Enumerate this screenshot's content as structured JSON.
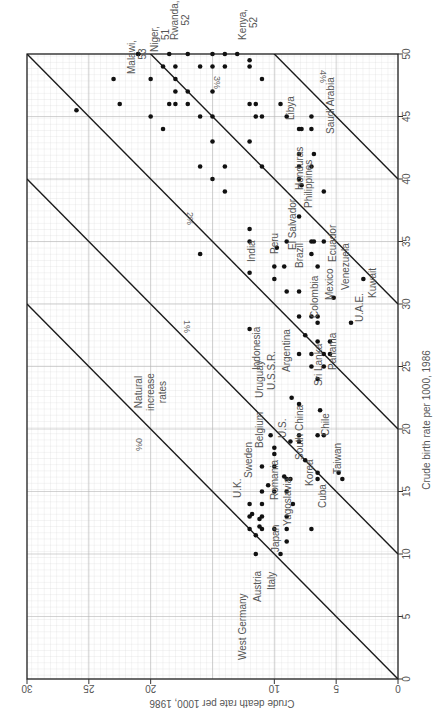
{
  "chart_data": {
    "type": "scatter",
    "title": "",
    "xlabel": "Crude birth rate per 1000, 1986",
    "ylabel": "Crude death rate per 1000, 1986",
    "xlim": [
      0,
      50
    ],
    "ylim": [
      0,
      30
    ],
    "x_ticks": [
      0,
      5,
      10,
      15,
      20,
      25,
      30,
      35,
      40,
      45,
      50
    ],
    "y_ticks": [
      0,
      5,
      10,
      20,
      25,
      30
    ],
    "grid": true,
    "orientation": "rotated 90 degrees clockwise (birth-rate axis on right edge, death-rate axis along bottom, read upside-down)",
    "annotation": "Natural increase rates",
    "reference_lines": [
      {
        "label": "0%",
        "rate": 0
      },
      {
        "label": "1%",
        "rate": 10
      },
      {
        "label": "2%",
        "rate": 20
      },
      {
        "label": "3%",
        "rate": 30
      },
      {
        "label": "4%",
        "rate": 40
      }
    ],
    "labeled_points": [
      {
        "label": "West Germany",
        "birth": 10,
        "death": 11.5
      },
      {
        "label": "Austria",
        "birth": 11.5,
        "death": 11.5
      },
      {
        "label": "Italy",
        "birth": 10,
        "death": 9.5
      },
      {
        "label": "U.K.",
        "birth": 13.2,
        "death": 11.8
      },
      {
        "label": "Sweden",
        "birth": 12.8,
        "death": 11.2
      },
      {
        "label": "Belgium",
        "birth": 12.2,
        "death": 11.2
      },
      {
        "label": "Romania",
        "birth": 15.5,
        "death": 10.5
      },
      {
        "label": "Yugoslavia",
        "birth": 16.2,
        "death": 9.2
      },
      {
        "label": "Uruguay",
        "birth": 18.5,
        "death": 10
      },
      {
        "label": "U.S.S.R.",
        "birth": 19.5,
        "death": 10.3
      },
      {
        "label": "U.S.",
        "birth": 16,
        "death": 8.7
      },
      {
        "label": "South China",
        "birth": 17.5,
        "death": 7.5
      },
      {
        "label": "Japan",
        "birth": 12,
        "death": 7
      },
      {
        "label": "Cuba",
        "birth": 16.5,
        "death": 6.5
      },
      {
        "label": "Korea",
        "birth": 19.5,
        "death": 6.5
      },
      {
        "label": "Taiwan",
        "birth": 16.5,
        "death": 4.8
      },
      {
        "label": "Chile",
        "birth": 21.5,
        "death": 6.3
      },
      {
        "label": "Argentina",
        "birth": 22.5,
        "death": 8.6
      },
      {
        "label": "Indonesia",
        "birth": 28,
        "death": 12
      },
      {
        "label": "Sri Lanka",
        "birth": 24,
        "death": 6.5
      },
      {
        "label": "Colombia",
        "birth": 27.5,
        "death": 7.5
      },
      {
        "label": "Panama",
        "birth": 27,
        "death": 5.5
      },
      {
        "label": "U.A.E.",
        "birth": 28.5,
        "death": 3.8
      },
      {
        "label": "Mexico",
        "birth": 29,
        "death": 6.5
      },
      {
        "label": "Venezuela",
        "birth": 30.5,
        "death": 5.2
      },
      {
        "label": "Kuwait",
        "birth": 32,
        "death": 2.8
      },
      {
        "label": "Brazil",
        "birth": 29,
        "death": 8
      },
      {
        "label": "Ecuador",
        "birth": 33,
        "death": 6.5
      },
      {
        "label": "India",
        "birth": 32.5,
        "death": 12
      },
      {
        "label": "El Salvador",
        "birth": 33,
        "death": 9.2
      },
      {
        "label": "Peru",
        "birth": 34.5,
        "death": 9.8
      },
      {
        "label": "Philippines",
        "birth": 35,
        "death": 6.8
      },
      {
        "label": "Honduras",
        "birth": 39.5,
        "death": 7.8
      },
      {
        "label": "Saudi Arabia",
        "birth": 42,
        "death": 6.8
      },
      {
        "label": "Libya",
        "birth": 44,
        "death": 7.8
      },
      {
        "label": "Kenya",
        "birth": 52,
        "death": 13,
        "note": "off-scale, shown as 52"
      },
      {
        "label": "Malawi",
        "birth": 53,
        "death": 21,
        "note": "off-scale, shown as 53"
      },
      {
        "label": "Niger",
        "birth": 51,
        "death": 21,
        "note": "off-scale, shown as 51"
      },
      {
        "label": "Rwanda",
        "birth": 52,
        "death": 18.5,
        "note": "off-scale, shown as 52"
      }
    ],
    "unlabeled_points": [
      {
        "birth": 45.5,
        "death": 26
      },
      {
        "birth": 48,
        "death": 23
      },
      {
        "birth": 46,
        "death": 22.5
      },
      {
        "birth": 48,
        "death": 20
      },
      {
        "birth": 45,
        "death": 20
      },
      {
        "birth": 44,
        "death": 19
      },
      {
        "birth": 49,
        "death": 19
      },
      {
        "birth": 49,
        "death": 18
      },
      {
        "birth": 48,
        "death": 18
      },
      {
        "birth": 47,
        "death": 18
      },
      {
        "birth": 46,
        "death": 18
      },
      {
        "birth": 46,
        "death": 18.5
      },
      {
        "birth": 47,
        "death": 17
      },
      {
        "birth": 46,
        "death": 17
      },
      {
        "birth": 50,
        "death": 17
      },
      {
        "birth": 50,
        "death": 15
      },
      {
        "birth": 50,
        "death": 14
      },
      {
        "birth": 49,
        "death": 16
      },
      {
        "birth": 49,
        "death": 15
      },
      {
        "birth": 49,
        "death": 14
      },
      {
        "birth": 49.5,
        "death": 12
      },
      {
        "birth": 49,
        "death": 12
      },
      {
        "birth": 47,
        "death": 15
      },
      {
        "birth": 46,
        "death": 12
      },
      {
        "birth": 46,
        "death": 11.5
      },
      {
        "birth": 46,
        "death": 9.5
      },
      {
        "birth": 45,
        "death": 16
      },
      {
        "birth": 45,
        "death": 15
      },
      {
        "birth": 45,
        "death": 11.5
      },
      {
        "birth": 45,
        "death": 11
      },
      {
        "birth": 45,
        "death": 9
      },
      {
        "birth": 43,
        "death": 15
      },
      {
        "birth": 43,
        "death": 12
      },
      {
        "birth": 41,
        "death": 16
      },
      {
        "birth": 41,
        "death": 14
      },
      {
        "birth": 41,
        "death": 11
      },
      {
        "birth": 40,
        "death": 15
      },
      {
        "birth": 39,
        "death": 14
      },
      {
        "birth": 48,
        "death": 11
      },
      {
        "birth": 44,
        "death": 8
      },
      {
        "birth": 45,
        "death": 7
      },
      {
        "birth": 44,
        "death": 7
      },
      {
        "birth": 42,
        "death": 8
      },
      {
        "birth": 41,
        "death": 8
      },
      {
        "birth": 41,
        "death": 7
      },
      {
        "birth": 40,
        "death": 8
      },
      {
        "birth": 39,
        "death": 6
      },
      {
        "birth": 37,
        "death": 8
      },
      {
        "birth": 36,
        "death": 12
      },
      {
        "birth": 35,
        "death": 12
      },
      {
        "birth": 34,
        "death": 16
      },
      {
        "birth": 32,
        "death": 10
      },
      {
        "birth": 33,
        "death": 10
      },
      {
        "birth": 35,
        "death": 9
      },
      {
        "birth": 34,
        "death": 7
      },
      {
        "birth": 35,
        "death": 7
      },
      {
        "birth": 35,
        "death": 6
      },
      {
        "birth": 31,
        "death": 9
      },
      {
        "birth": 31,
        "death": 8
      },
      {
        "birth": 29,
        "death": 7
      },
      {
        "birth": 28.5,
        "death": 6.5
      },
      {
        "birth": 27,
        "death": 6.5
      },
      {
        "birth": 26,
        "death": 8
      },
      {
        "birth": 26,
        "death": 7
      },
      {
        "birth": 25,
        "death": 7
      },
      {
        "birth": 26,
        "death": 6
      },
      {
        "birth": 22,
        "death": 8
      },
      {
        "birth": 19.5,
        "death": 8
      },
      {
        "birth": 19,
        "death": 8
      },
      {
        "birth": 19,
        "death": 8.7
      },
      {
        "birth": 17,
        "death": 11
      },
      {
        "birth": 18,
        "death": 10
      },
      {
        "birth": 17,
        "death": 10
      },
      {
        "birth": 16,
        "death": 9
      },
      {
        "birth": 15,
        "death": 10
      },
      {
        "birth": 15,
        "death": 11
      },
      {
        "birth": 14,
        "death": 11
      },
      {
        "birth": 14,
        "death": 12
      },
      {
        "birth": 13,
        "death": 12
      },
      {
        "birth": 13,
        "death": 11
      },
      {
        "birth": 13,
        "death": 9
      },
      {
        "birth": 12,
        "death": 12
      },
      {
        "birth": 12,
        "death": 11
      },
      {
        "birth": 12,
        "death": 10
      },
      {
        "birth": 11,
        "death": 9
      },
      {
        "birth": 12,
        "death": 9
      },
      {
        "birth": 14,
        "death": 8.5
      },
      {
        "birth": 15,
        "death": 9
      },
      {
        "birth": 16,
        "death": 6.5
      },
      {
        "birth": 16,
        "death": 4.5
      },
      {
        "birth": 19.5,
        "death": 6
      },
      {
        "birth": 25,
        "death": 6
      },
      {
        "birth": 26,
        "death": 5.5
      }
    ]
  }
}
